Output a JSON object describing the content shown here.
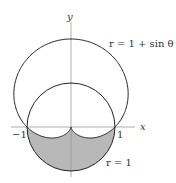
{
  "diagram": {
    "axes": {
      "x_label": "x",
      "y_label": "y",
      "tick_left": "−1",
      "tick_right": "1"
    },
    "curves": [
      {
        "name": "cardioid",
        "label": "r = 1 + sin θ"
      },
      {
        "name": "unit-circle",
        "label": "r = 1"
      }
    ],
    "shaded_region": "inside r = 1, outside r = 1 + sin θ",
    "colors": {
      "stroke": "#222222",
      "fill": "#b8b8b8",
      "axis": "#999999"
    }
  }
}
